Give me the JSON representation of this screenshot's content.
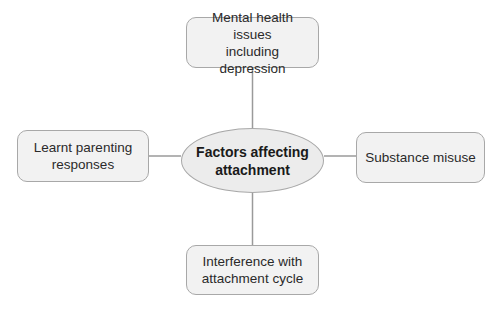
{
  "diagram": {
    "type": "mind-map",
    "center": {
      "label_line1": "Factors affecting",
      "label_line2": "attachment"
    },
    "nodes": [
      {
        "position": "top",
        "label_line1": "Mental health issues",
        "label_line2": "including depression"
      },
      {
        "position": "left",
        "label_line1": "Learnt parenting",
        "label_line2": "responses"
      },
      {
        "position": "right",
        "label_line1": "Substance misuse",
        "label_line2": ""
      },
      {
        "position": "bottom",
        "label_line1": "Interference with",
        "label_line2": "attachment cycle"
      }
    ],
    "colors": {
      "box_fill": "#f2f2f2",
      "ellipse_fill": "#ececec",
      "border": "#a8a8a8",
      "connector": "#9a9a9a",
      "text": "#2a2a2a"
    }
  }
}
